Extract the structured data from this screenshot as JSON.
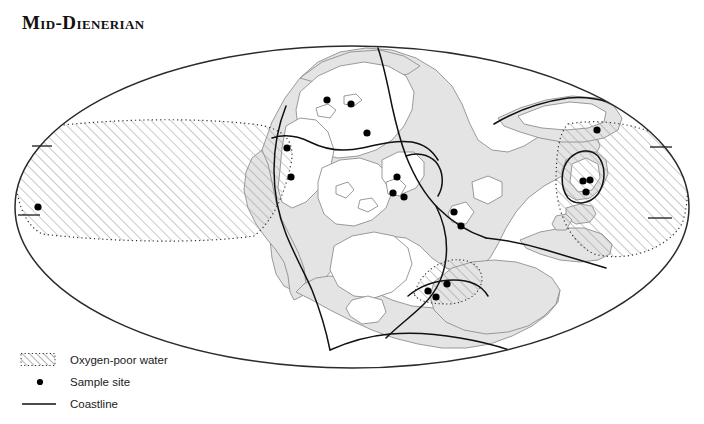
{
  "figure": {
    "title": "Mid-Dienerian",
    "projection": "mollweide-ellipse",
    "background_color": "#ffffff",
    "ink_color": "#111111"
  },
  "map": {
    "shelf_fill": "#e3e3e3",
    "shelf_outline": "#8a8a8a",
    "land_fill": "#ffffff",
    "coastline_color": "#111111",
    "anoxic_hatch_color": "#9a9a9a",
    "anoxic_border_style": "dotted",
    "frame_color": "#2a2a2a",
    "ellipse": {
      "cx": 352,
      "cy": 207,
      "rx": 337,
      "ry": 161
    },
    "latitude_ticks": [
      {
        "side": "left",
        "y": 146
      },
      {
        "side": "left",
        "y": 215
      },
      {
        "side": "right",
        "y": 147
      },
      {
        "side": "right",
        "y": 218
      }
    ],
    "sample_sites": [
      {
        "x": 38,
        "y": 207
      },
      {
        "x": 287,
        "y": 148
      },
      {
        "x": 291,
        "y": 177
      },
      {
        "x": 327,
        "y": 100
      },
      {
        "x": 351,
        "y": 104
      },
      {
        "x": 367,
        "y": 133
      },
      {
        "x": 397,
        "y": 177
      },
      {
        "x": 393,
        "y": 193
      },
      {
        "x": 404,
        "y": 197
      },
      {
        "x": 454,
        "y": 212
      },
      {
        "x": 461,
        "y": 226
      },
      {
        "x": 428,
        "y": 291
      },
      {
        "x": 447,
        "y": 284
      },
      {
        "x": 436,
        "y": 297
      },
      {
        "x": 597,
        "y": 130
      },
      {
        "x": 583,
        "y": 181
      },
      {
        "x": 590,
        "y": 180
      },
      {
        "x": 586,
        "y": 192
      }
    ],
    "anoxic_regions": [
      {
        "name": "panthalassa-west-lens",
        "label": "large western oxygen-poor lens"
      },
      {
        "name": "tethys-east-wedge",
        "label": "eastern oxygen-poor wedge"
      },
      {
        "name": "southern-small-patch",
        "label": "small southern oxygen-poor patch"
      }
    ]
  },
  "legend": {
    "items": [
      {
        "key": "oxygen-poor-water",
        "label": "Oxygen-poor water",
        "symbol": "hatch"
      },
      {
        "key": "sample-site",
        "label": "Sample site",
        "symbol": "dot"
      },
      {
        "key": "coastline",
        "label": "Coastline",
        "symbol": "line"
      }
    ]
  }
}
